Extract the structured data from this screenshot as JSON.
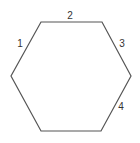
{
  "diagram": {
    "shape": "hexagon",
    "stroke_color": "#555555",
    "stroke_width": 1.2,
    "fill_color": "#ffffff",
    "vertices": [
      [
        41,
        22
      ],
      [
        102,
        22
      ],
      [
        131,
        76
      ],
      [
        101,
        131
      ],
      [
        41,
        131
      ],
      [
        11,
        76
      ]
    ],
    "labels": [
      {
        "text": "1",
        "x": 20,
        "y": 44
      },
      {
        "text": "2",
        "x": 70,
        "y": 16
      },
      {
        "text": "3",
        "x": 122,
        "y": 44
      },
      {
        "text": "4",
        "x": 121,
        "y": 107
      }
    ]
  }
}
